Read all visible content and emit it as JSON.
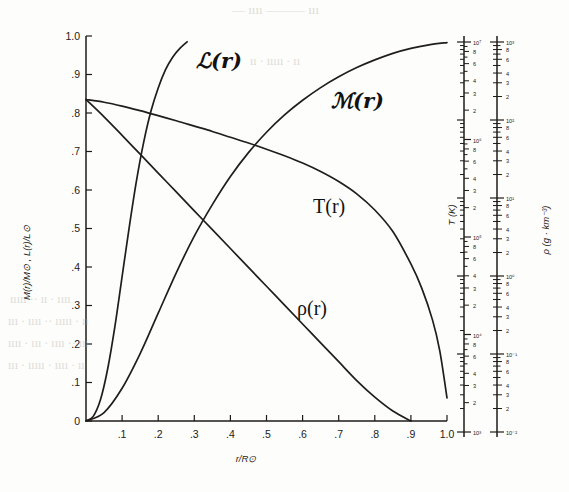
{
  "figure": {
    "title_hidden": "Solar interior structure",
    "axes": {
      "left": {
        "label": "M(r)/M⊙ , L(r)/L⊙",
        "ticks": [
          "1.0",
          ".9",
          ".8",
          ".7",
          ".6",
          ".5",
          ".4",
          ".3",
          ".2",
          ".1",
          "0"
        ],
        "min": 0,
        "max": 1.0
      },
      "bottom": {
        "label": "r/R⊙",
        "ticks": [
          ".1",
          ".2",
          ".3",
          ".4",
          ".5",
          ".6",
          ".7",
          ".8",
          ".9",
          "1.0"
        ],
        "min": 0,
        "max": 1.0
      },
      "right_temperature": {
        "label": "T (K)",
        "decades": [
          "10⁷",
          "10⁶",
          "10⁵",
          "10⁴",
          "10³"
        ],
        "minor_labels": [
          "8",
          "6",
          "4",
          "3",
          "2"
        ],
        "min_exp": 3,
        "max_exp": 7
      },
      "right_density": {
        "label": "ρ (g · km⁻³)",
        "decades": [
          "10³",
          "10²",
          "10¹",
          "10⁰",
          "10⁻¹",
          "10⁻²"
        ],
        "minor_labels": [
          "8",
          "6",
          "4",
          "3",
          "2"
        ],
        "min_exp": -2,
        "max_exp": 3
      }
    },
    "curve_labels": [
      {
        "name": "luminosity",
        "text": "ℒ(r)",
        "style": "script"
      },
      {
        "name": "mass",
        "text": "ℳ(r)",
        "style": "script"
      },
      {
        "name": "temperature",
        "text": "T(r)",
        "style": "roman"
      },
      {
        "name": "density",
        "text": "ρ(r)",
        "style": "roman"
      }
    ],
    "ghost_text": [
      {
        "text": "— ıııı ——— ııı",
        "x": 232,
        "y": 10,
        "size": 13
      },
      {
        "text": "ıı ·  ııııı  · ıı",
        "x": 250,
        "y": 62,
        "size": 12
      },
      {
        "text": "ııııı ·· ıı · ıııı",
        "x": 10,
        "y": 300,
        "size": 12
      },
      {
        "text": "ııı · ıııı ·· ııııı · ıı",
        "x": 8,
        "y": 322,
        "size": 12
      },
      {
        "text": "ıııı · ııı · ıııı ·· ııı",
        "x": 8,
        "y": 344,
        "size": 12
      },
      {
        "text": "ııı · ııııı · ıııı · ıı",
        "x": 8,
        "y": 366,
        "size": 12
      }
    ]
  },
  "chart_data": {
    "type": "line",
    "xlabel": "r/R⊙",
    "ylabel": "M(r)/M⊙ , L(r)/L⊙",
    "xlim": [
      0,
      1.0
    ],
    "ylim": [
      0,
      1.0
    ],
    "grid": false,
    "legend": "inline-curve-labels",
    "right_axis_1": {
      "label": "T (K)",
      "scale": "log",
      "range": [
        1000,
        10000000
      ]
    },
    "right_axis_2": {
      "label": "ρ (g · km⁻³)",
      "scale": "log",
      "range": [
        0.01,
        1000
      ]
    },
    "series": [
      {
        "name": "ℒ(r)",
        "axis": "left",
        "x": [
          0.0,
          0.02,
          0.04,
          0.06,
          0.08,
          0.1,
          0.12,
          0.14,
          0.16,
          0.18,
          0.2,
          0.22,
          0.24,
          0.26,
          0.28
        ],
        "values": [
          0.0,
          0.012,
          0.055,
          0.135,
          0.245,
          0.375,
          0.505,
          0.625,
          0.725,
          0.805,
          0.865,
          0.912,
          0.945,
          0.968,
          0.985
        ]
      },
      {
        "name": "ℳ(r)",
        "axis": "left",
        "x": [
          0.0,
          0.05,
          0.1,
          0.15,
          0.2,
          0.25,
          0.3,
          0.35,
          0.4,
          0.45,
          0.5,
          0.55,
          0.6,
          0.65,
          0.7,
          0.75,
          0.8,
          0.85,
          0.9,
          0.95,
          1.0
        ],
        "values": [
          0.0,
          0.022,
          0.085,
          0.175,
          0.28,
          0.385,
          0.48,
          0.562,
          0.635,
          0.697,
          0.75,
          0.795,
          0.833,
          0.866,
          0.894,
          0.918,
          0.938,
          0.955,
          0.968,
          0.977,
          0.983
        ]
      },
      {
        "name": "T(r)",
        "axis": "right_temperature",
        "x": [
          0.0,
          0.05,
          0.1,
          0.15,
          0.2,
          0.25,
          0.3,
          0.35,
          0.4,
          0.45,
          0.5,
          0.55,
          0.6,
          0.65,
          0.7,
          0.75,
          0.8,
          0.85,
          0.9,
          0.93,
          0.96,
          0.98,
          1.0
        ],
        "values_normalized": [
          0.835,
          0.828,
          0.818,
          0.806,
          0.793,
          0.78,
          0.766,
          0.752,
          0.737,
          0.722,
          0.706,
          0.689,
          0.67,
          0.648,
          0.622,
          0.59,
          0.548,
          0.492,
          0.408,
          0.345,
          0.262,
          0.182,
          0.06
        ],
        "note": "Central T ≈ 1.5×10⁷ K falling to ≈ 5800 K at the surface"
      },
      {
        "name": "ρ(r)",
        "axis": "right_density",
        "x": [
          0.0,
          0.05,
          0.1,
          0.15,
          0.2,
          0.25,
          0.3,
          0.35,
          0.4,
          0.45,
          0.5,
          0.55,
          0.6,
          0.65,
          0.7,
          0.75,
          0.8,
          0.85,
          0.9
        ],
        "values_normalized": [
          0.835,
          0.79,
          0.742,
          0.693,
          0.644,
          0.595,
          0.546,
          0.497,
          0.448,
          0.399,
          0.35,
          0.301,
          0.252,
          0.203,
          0.154,
          0.105,
          0.062,
          0.026,
          0.0
        ],
        "note": "Central ρ ≈ 1.5×10² g·cm⁻³ declining toward the photosphere"
      }
    ]
  }
}
